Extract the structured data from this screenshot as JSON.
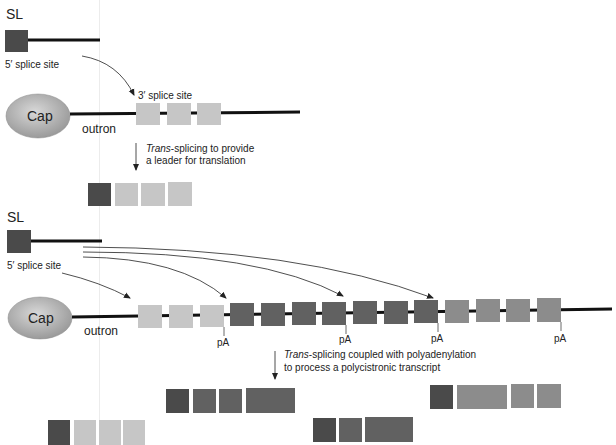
{
  "colors": {
    "sl_exon": "#4a4a4a",
    "light_exon": "#c6c6c6",
    "dark_exon": "#616161",
    "mid_exon": "#8c8c8c",
    "line": "#111111",
    "cap_fill": "#bdbdbd"
  },
  "panel1": {
    "sl_label": "SL",
    "five_prime_label": "5′ splice site",
    "three_prime_label": "3′ splice site",
    "cap_label": "Cap",
    "outron_label": "outron",
    "arrow_text_italic": "Trans",
    "arrow_text_rest": "-splicing to provide",
    "arrow_text_line2": "a leader for translation"
  },
  "panel2": {
    "sl_label": "SL",
    "five_prime_label": "5′ splice site",
    "cap_label": "Cap",
    "outron_label": "outron",
    "pa_labels": [
      "pA",
      "pA",
      "pA",
      "pA"
    ],
    "arrow_text_italic": "Trans",
    "arrow_text_rest": "-splicing coupled with polyadenylation",
    "arrow_text_line2": "to process a polycistronic transcript"
  }
}
